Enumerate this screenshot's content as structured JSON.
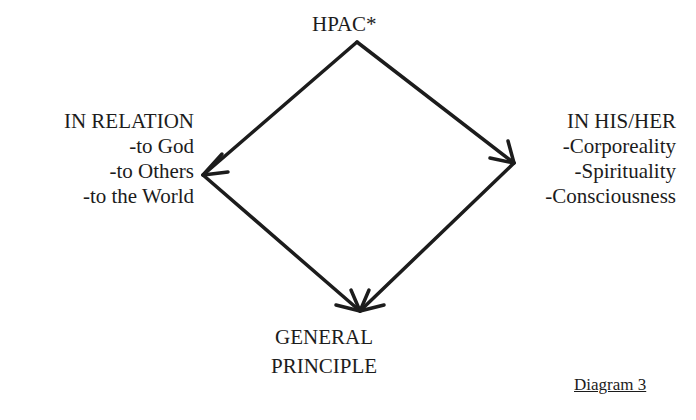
{
  "diagram": {
    "top_node": {
      "label": "HPAC*"
    },
    "left_node": {
      "title": "IN RELATION",
      "items": [
        "-to God",
        "-to Others",
        "-to the World"
      ]
    },
    "right_node": {
      "title": "IN HIS/HER",
      "items": [
        "-Corporeality",
        "-Spirituality",
        "-Consciousness"
      ]
    },
    "bottom_node": {
      "lines": [
        "GENERAL",
        "PRINCIPLE"
      ]
    },
    "edges": [
      {
        "from": "top_node",
        "to": "left_node"
      },
      {
        "from": "top_node",
        "to": "right_node"
      },
      {
        "from": "left_node",
        "to": "bottom_node"
      },
      {
        "from": "right_node",
        "to": "bottom_node"
      }
    ],
    "caption": "Diagram 3",
    "stroke_color": "#1c1c1c"
  }
}
